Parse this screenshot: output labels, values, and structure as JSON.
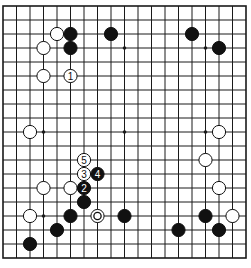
{
  "board": {
    "size": 19,
    "origin_x": 3,
    "origin_y": 6,
    "spacing_x": 13.5,
    "spacing_y": 14,
    "stone_radius": 6.6,
    "line_color": "#1a1a1a",
    "black_color": "#111111",
    "white_color": "#ffffff",
    "star_points": [
      [
        3,
        3
      ],
      [
        9,
        3
      ],
      [
        15,
        3
      ],
      [
        3,
        9
      ],
      [
        9,
        9
      ],
      [
        15,
        9
      ],
      [
        3,
        15
      ],
      [
        9,
        15
      ],
      [
        15,
        15
      ]
    ]
  },
  "stones": [
    {
      "color": "white",
      "col": 4,
      "row": 2
    },
    {
      "color": "black",
      "col": 5,
      "row": 2
    },
    {
      "color": "black",
      "col": 8,
      "row": 2
    },
    {
      "color": "black",
      "col": 14,
      "row": 2
    },
    {
      "color": "white",
      "col": 3,
      "row": 3
    },
    {
      "color": "black",
      "col": 5,
      "row": 3
    },
    {
      "color": "black",
      "col": 16,
      "row": 3
    },
    {
      "color": "white",
      "col": 3,
      "row": 5
    },
    {
      "color": "white",
      "col": 5,
      "row": 5,
      "label": "1"
    },
    {
      "color": "white",
      "col": 2,
      "row": 9
    },
    {
      "color": "white",
      "col": 16,
      "row": 9
    },
    {
      "color": "white",
      "col": 15,
      "row": 11
    },
    {
      "color": "white",
      "col": 6,
      "row": 11,
      "label": "5"
    },
    {
      "color": "white",
      "col": 6,
      "row": 12,
      "label": "3"
    },
    {
      "color": "black",
      "col": 7,
      "row": 12,
      "label": "4"
    },
    {
      "color": "white",
      "col": 3,
      "row": 13
    },
    {
      "color": "white",
      "col": 5,
      "row": 13
    },
    {
      "color": "black",
      "col": 6,
      "row": 13,
      "label": "2"
    },
    {
      "color": "white",
      "col": 16,
      "row": 13
    },
    {
      "color": "black",
      "col": 6,
      "row": 14
    },
    {
      "color": "white",
      "col": 2,
      "row": 15
    },
    {
      "color": "black",
      "col": 5,
      "row": 15
    },
    {
      "color": "white",
      "col": 7,
      "row": 15,
      "marker": "circle"
    },
    {
      "color": "black",
      "col": 9,
      "row": 15
    },
    {
      "color": "black",
      "col": 15,
      "row": 15
    },
    {
      "color": "white",
      "col": 17,
      "row": 15
    },
    {
      "color": "black",
      "col": 4,
      "row": 16
    },
    {
      "color": "black",
      "col": 13,
      "row": 16
    },
    {
      "color": "black",
      "col": 16,
      "row": 16
    },
    {
      "color": "black",
      "col": 2,
      "row": 17
    }
  ]
}
